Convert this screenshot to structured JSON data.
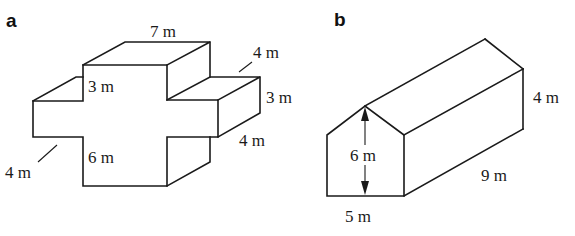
{
  "figure_a": {
    "panel_label": "a",
    "shape": "cross-shaped prism",
    "dimensions": {
      "top_width": "7 m",
      "top_right_depth": "4 m",
      "right_arm_height": "3 m",
      "right_arm_length": "4 m",
      "inner_top_height": "3 m",
      "inner_bottom_height": "6 m",
      "left_depth": "4 m"
    }
  },
  "figure_b": {
    "panel_label": "b",
    "shape": "pentagonal prism (house shape)",
    "dimensions": {
      "wall_height": "4 m",
      "total_height": "6 m",
      "length": "9 m",
      "base_width": "5 m"
    }
  },
  "colors": {
    "line": "#1a1a1a",
    "background": "#ffffff"
  }
}
